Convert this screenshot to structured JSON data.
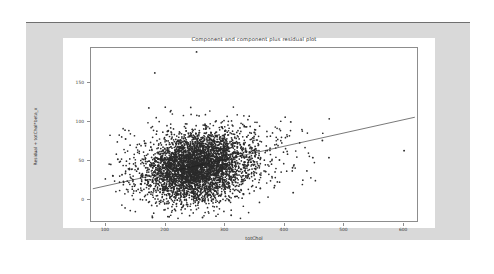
{
  "figure": {
    "background_color": "#d9d9d9",
    "canvas_color": "#ffffff",
    "axes_border_color": "#8d8d8d"
  },
  "chart_data": {
    "type": "scatter",
    "title": "Component and component plus residual plot",
    "xlabel": "totChol",
    "ylabel": "Residual + totChol*beta_x",
    "xlim": [
      75,
      625
    ],
    "ylim": [
      -30,
      195
    ],
    "xticks": [
      100,
      200,
      300,
      400,
      500,
      600
    ],
    "yticks": [
      0,
      50,
      100,
      150
    ],
    "grid": false,
    "legend": null,
    "marker_color": "#2b2b2b",
    "line_color": "#1f1f1f",
    "series": [
      {
        "name": "component-plus-residual points",
        "n_points": 4400,
        "cloud": {
          "x_center": 245,
          "x_spread": 42,
          "y_center": 42,
          "y_spread": 22,
          "x_range": [
            110,
            360
          ],
          "y_range": [
            -25,
            120
          ]
        },
        "notable_outliers": [
          {
            "x": 252,
            "y": 190
          },
          {
            "x": 182,
            "y": 163
          },
          {
            "x": 172,
            "y": 118
          },
          {
            "x": 133,
            "y": 78
          },
          {
            "x": 120,
            "y": 52
          },
          {
            "x": 127,
            "y": 32
          },
          {
            "x": 600,
            "y": 63
          },
          {
            "x": 463,
            "y": 76
          },
          {
            "x": 410,
            "y": 100
          },
          {
            "x": 447,
            "y": 54
          },
          {
            "x": 474,
            "y": 54
          },
          {
            "x": 437,
            "y": 37
          },
          {
            "x": 413,
            "y": 41
          },
          {
            "x": 391,
            "y": 51
          },
          {
            "x": 383,
            "y": 18
          },
          {
            "x": 414,
            "y": 9
          },
          {
            "x": 310,
            "y": -20
          },
          {
            "x": 206,
            "y": -22
          },
          {
            "x": 178,
            "y": -23
          },
          {
            "x": 262,
            "y": -23
          }
        ]
      }
    ],
    "fit_line": {
      "name": "component fit",
      "x_start": 78,
      "y_start": 14,
      "x_end": 618,
      "y_end": 106,
      "slope_per_unit_x": 0.17
    }
  }
}
